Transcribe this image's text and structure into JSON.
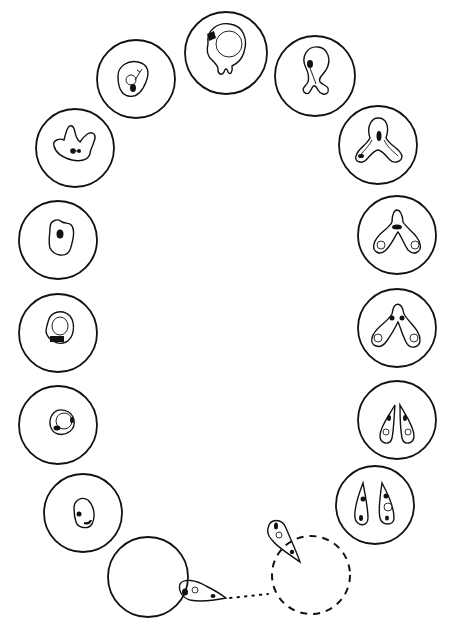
{
  "diagram": {
    "type": "life-cycle",
    "colors": {
      "ink": "#111111",
      "background": "#ffffff"
    },
    "stages": [
      {
        "id": "s1",
        "position": "bottom-left",
        "shape": "cell-with-attached-sporozoite",
        "cx": 148,
        "cy": 577,
        "r": 40
      },
      {
        "id": "s2",
        "position": "left-1",
        "shape": "oval-trophozoite",
        "cx": 83,
        "cy": 513,
        "r": 39
      },
      {
        "id": "s3",
        "position": "left-2",
        "shape": "ring-form",
        "cx": 58,
        "cy": 425,
        "r": 39
      },
      {
        "id": "s4",
        "position": "left-3",
        "shape": "ring-with-vacuole",
        "cx": 58,
        "cy": 333,
        "r": 39
      },
      {
        "id": "s5",
        "position": "left-4",
        "shape": "compact-trophozoite",
        "cx": 58,
        "cy": 240,
        "r": 39
      },
      {
        "id": "s6",
        "position": "left-5",
        "shape": "amoeboid-trophozoite",
        "cx": 75,
        "cy": 148,
        "r": 39
      },
      {
        "id": "s7",
        "position": "upper-left",
        "shape": "trophozoite-with-vacuole",
        "cx": 136,
        "cy": 79,
        "r": 39
      },
      {
        "id": "s8",
        "position": "top",
        "shape": "large-ring-budding",
        "cx": 226,
        "cy": 53,
        "r": 41
      },
      {
        "id": "s9",
        "position": "upper-right",
        "shape": "early-division",
        "cx": 315,
        "cy": 76,
        "r": 40
      },
      {
        "id": "s10",
        "position": "right-1",
        "shape": "tri-lobed-division",
        "cx": 378,
        "cy": 145,
        "r": 39
      },
      {
        "id": "s11",
        "position": "right-2",
        "shape": "bilobed-division",
        "cx": 397,
        "cy": 235,
        "r": 39
      },
      {
        "id": "s12",
        "position": "right-3",
        "shape": "paired-merozoites-joined",
        "cx": 397,
        "cy": 328,
        "r": 39
      },
      {
        "id": "s13",
        "position": "right-4",
        "shape": "paired-pyriforms",
        "cx": 397,
        "cy": 420,
        "r": 39
      },
      {
        "id": "s14",
        "position": "right-5",
        "shape": "separated-pyriforms",
        "cx": 375,
        "cy": 505,
        "r": 39
      },
      {
        "id": "s15",
        "position": "bottom-right",
        "shape": "free-merozoite-leaving-ghost-cell",
        "cx": 311,
        "cy": 575,
        "r": 39,
        "dashed": true
      }
    ],
    "connectors": [
      {
        "from": "s15",
        "to": "s1",
        "style": "dotted"
      }
    ],
    "labels": []
  }
}
